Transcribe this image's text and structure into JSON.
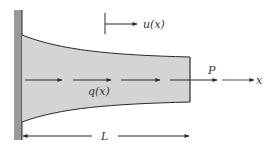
{
  "diagram": {
    "type": "tapered-bar-axial-load",
    "labels": {
      "displacement": "u(x)",
      "distributed_load": "q(x)",
      "end_force": "P",
      "axis": "x",
      "length": "L"
    },
    "colors": {
      "wall": "#9a9a9a",
      "bar_fill": "#d4d4d4",
      "line": "#2a2a2a"
    }
  }
}
